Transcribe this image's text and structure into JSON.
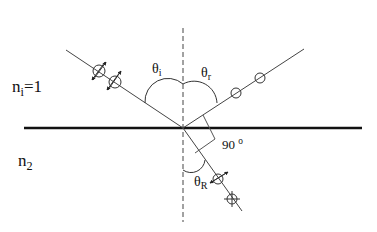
{
  "diagram": {
    "type": "reflection-refraction-polarization",
    "labels": {
      "n_i_base": "n",
      "n_i_sub": "i",
      "n_i_eq": "=1",
      "n_2_base": "n",
      "n_2_sub": "2",
      "theta_i_base": "θ",
      "theta_i_sub": "i",
      "theta_r_base": "θ",
      "theta_r_sub": "r",
      "theta_R_base": "θ",
      "theta_R_sub": "R",
      "right_angle_value": "90",
      "right_angle_unit": "o"
    },
    "elements": {
      "interface": "horizontal boundary between media",
      "normal": "dashed vertical normal line",
      "incident_ray": "with two polarization markers (in-plane arrows + circles)",
      "reflected_ray": "with two circle markers (s-polarization only)",
      "refracted_ray": "with two polarization markers",
      "angle_between_reflected_and_refracted": "90 o"
    }
  }
}
